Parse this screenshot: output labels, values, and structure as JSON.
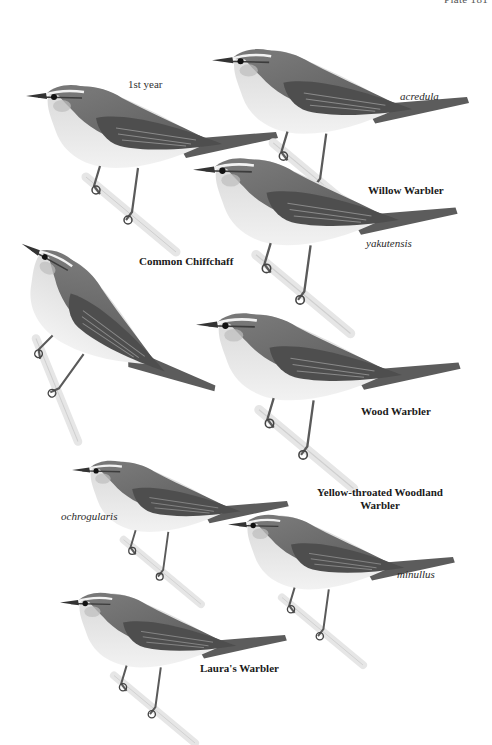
{
  "plate": {
    "number_label": "Plate 181"
  },
  "labels": {
    "first_year": "1st year",
    "acredula": "acredula",
    "willow_warbler": "Willow Warbler",
    "yakutensis": "yakutensis",
    "common_chiffchaff": "Common Chiffchaff",
    "wood_warbler": "Wood Warbler",
    "yellow_throated_line1": "Yellow-throated Woodland",
    "yellow_throated_line2": "Warbler",
    "ochrogularis": "ochrogularis",
    "minullus": "minullus",
    "lauras_warbler": "Laura's Warbler"
  },
  "birds": [
    {
      "id": "willow-warbler-1st-year",
      "species": "Willow Warbler",
      "caption": "1st year"
    },
    {
      "id": "willow-warbler-acredula",
      "species": "Willow Warbler",
      "caption": "acredula"
    },
    {
      "id": "willow-warbler-yakutensis",
      "species": "Willow Warbler",
      "caption": "yakutensis"
    },
    {
      "id": "common-chiffchaff",
      "species": "Common Chiffchaff",
      "caption": ""
    },
    {
      "id": "wood-warbler",
      "species": "Wood Warbler",
      "caption": ""
    },
    {
      "id": "yellow-throated-woodland-warbler-ochrogularis",
      "species": "Yellow-throated Woodland Warbler",
      "caption": "ochrogularis"
    },
    {
      "id": "yellow-throated-woodland-warbler-minullus",
      "species": "Yellow-throated Woodland Warbler",
      "caption": "minullus"
    },
    {
      "id": "lauras-warbler",
      "species": "Laura's Warbler",
      "caption": ""
    }
  ],
  "colors": {
    "background": "#ffffff",
    "upperparts": "#6e6e6e",
    "wing": "#4f4f4f",
    "underparts": "#e6e6e6",
    "cap": "#7a7a7a",
    "supercilium": "#f0f0f0",
    "legs": "#5a5a5a",
    "branch": "#e9e9e9"
  }
}
